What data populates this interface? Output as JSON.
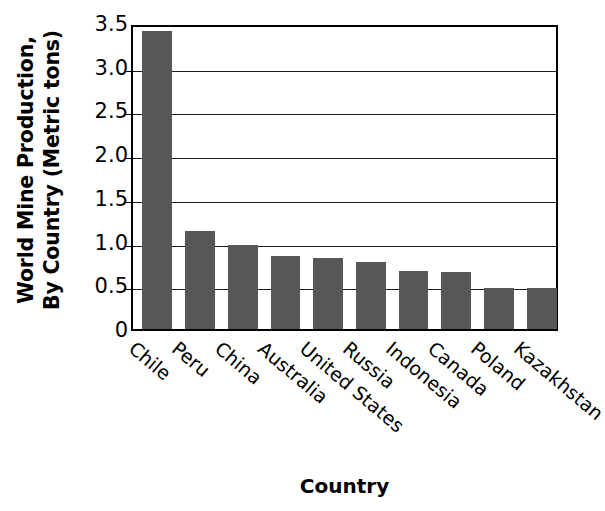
{
  "chart_data": {
    "type": "bar",
    "title": "",
    "xlabel": "Country",
    "ylabel": "World Mine Production, By Country (Metric tons)",
    "ylabel_lines": [
      "World Mine Production,",
      "By Country (Metric tons)"
    ],
    "categories": [
      "Chile",
      "Peru",
      "China",
      "Australia",
      "United States",
      "Russia",
      "Indonesia",
      "Canada",
      "Poland",
      "Kazakhstan"
    ],
    "values": [
      3.43,
      1.14,
      0.98,
      0.86,
      0.84,
      0.79,
      0.69,
      0.67,
      0.49,
      0.49
    ],
    "ylim": [
      0,
      3.5
    ],
    "ytick_labels": [
      "3.5",
      "3.0",
      "2.5",
      "2.0",
      "1.5",
      "1.0",
      "0.5",
      "0"
    ],
    "ytick_values": [
      3.5,
      3.0,
      2.5,
      2.0,
      1.5,
      1.0,
      0.5,
      0
    ],
    "grid": true,
    "legend": false,
    "bar_color": "#58585a",
    "axis_color": "#000000",
    "background_color": "#ffffff"
  }
}
